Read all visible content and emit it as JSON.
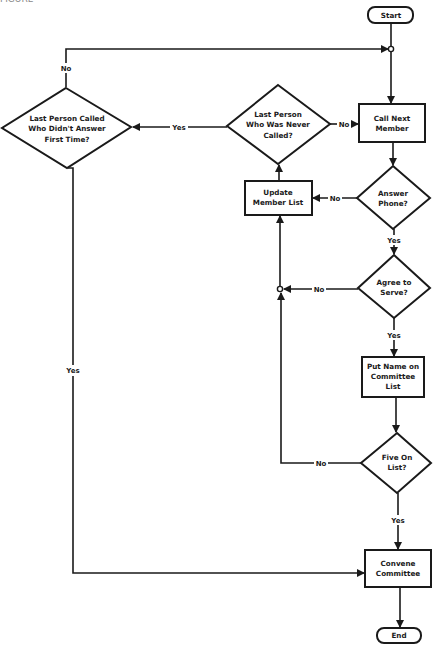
{
  "caption": "FIGURE",
  "nodes": {
    "start": {
      "label": "Start"
    },
    "call_next": {
      "lines": [
        "Call Next",
        "Member"
      ]
    },
    "answer_phone": {
      "lines": [
        "Answer",
        "Phone?"
      ]
    },
    "agree_serve": {
      "lines": [
        "Agree to",
        "Serve?"
      ]
    },
    "put_name": {
      "lines": [
        "Put Name on",
        "Committee",
        "List"
      ]
    },
    "five_on_list": {
      "lines": [
        "Five On",
        "List?"
      ]
    },
    "convene": {
      "lines": [
        "Convene",
        "Committee"
      ]
    },
    "end": {
      "label": "End"
    },
    "update_list": {
      "lines": [
        "Update",
        "Member List"
      ]
    },
    "never_called": {
      "lines": [
        "Last Person",
        "Who Was Never",
        "Called?"
      ]
    },
    "didnt_answer": {
      "lines": [
        "Last Person Called",
        "Who Didn't Answer",
        "First Time?"
      ]
    }
  },
  "edge_labels": {
    "never_called_no": "No",
    "never_called_yes": "Yes",
    "answer_no": "No",
    "answer_yes": "Yes",
    "agree_no": "No",
    "agree_yes": "Yes",
    "five_no": "No",
    "five_yes": "Yes",
    "didnt_answer_no": "No",
    "didnt_answer_yes": "Yes"
  },
  "colors": {
    "stroke": "#1a1a1a",
    "background": "#ffffff"
  }
}
